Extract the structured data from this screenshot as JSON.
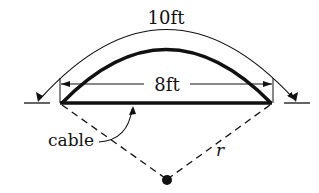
{
  "diagram": {
    "labels": {
      "arc_length": "10ft",
      "chord_length": "8ft",
      "cable": "cable",
      "radius": "r"
    },
    "colors": {
      "ink": "#111111",
      "background": "#ffffff"
    },
    "elements": [
      "outer arc dimension (10ft) with arrows",
      "thick cable arc",
      "thick chord line",
      "chord dimension line (8ft) with arrows",
      "dashed radius lines to center point",
      "center point dot",
      "ground/support marks at both ends"
    ]
  }
}
